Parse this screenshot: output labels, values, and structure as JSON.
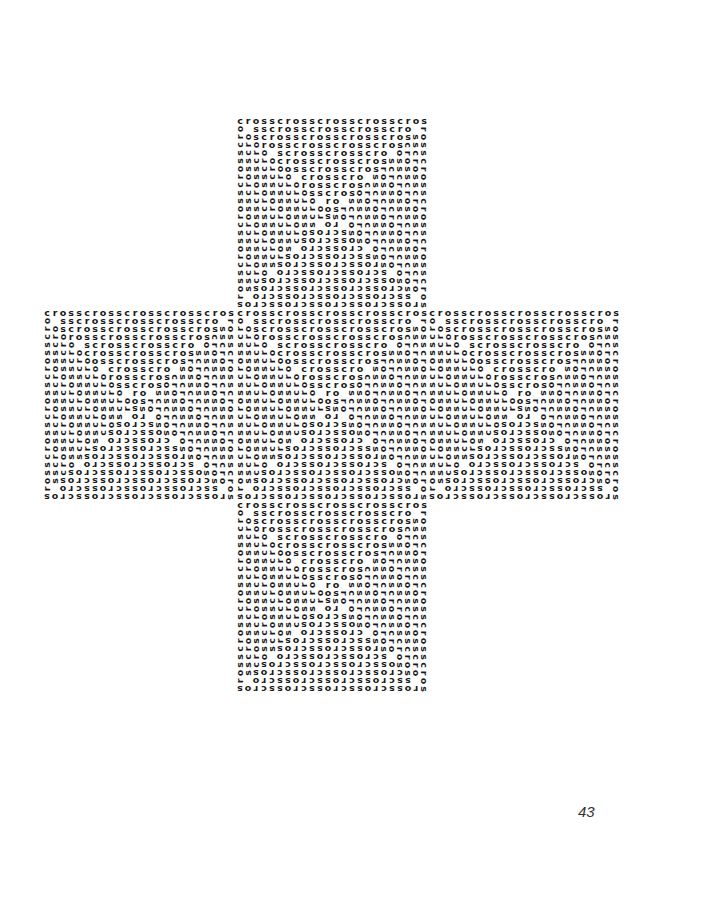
{
  "page": {
    "page_number": "43"
  },
  "poem": {
    "word": "cross",
    "grid_size": 24,
    "blocks": [
      {
        "id": "top",
        "left": 236,
        "top": 117
      },
      {
        "id": "left",
        "left": 43,
        "top": 309
      },
      {
        "id": "center",
        "left": 236,
        "top": 309
      },
      {
        "id": "right",
        "left": 428,
        "top": 309
      },
      {
        "id": "bottom",
        "left": 236,
        "top": 501
      }
    ],
    "text_color": "#1a1a1a"
  }
}
